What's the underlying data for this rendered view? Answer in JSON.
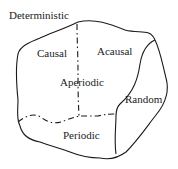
{
  "diagram": {
    "type": "venn-region",
    "labels": {
      "outer": "Deterministic",
      "causal": "Causal",
      "acausal": "Acausal",
      "aperiodic": "Aperiodic",
      "random": "Random",
      "periodic": "Periodic"
    },
    "colors": {
      "stroke": "#1a1a1a",
      "text": "#222222",
      "background": "#ffffff"
    }
  }
}
